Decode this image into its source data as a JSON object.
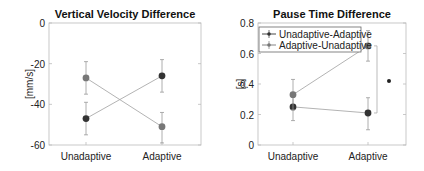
{
  "chart_data": [
    {
      "type": "line",
      "title": "Vertical Velocity Difference",
      "xlabel": "",
      "ylabel": "[mm/s]",
      "categories": [
        "Unadaptive",
        "Adaptive"
      ],
      "ylim": [
        -60,
        0
      ],
      "yticks": [
        0,
        -20,
        -40,
        -60
      ],
      "grid": false,
      "legend": null,
      "series": [
        {
          "name": "Unadaptive-Adaptive",
          "color": "#333333",
          "values": [
            -47,
            -26
          ],
          "err_low": [
            -55,
            -34
          ],
          "err_high": [
            -39,
            -18
          ]
        },
        {
          "name": "Adaptive-Unadaptive",
          "color": "#777777",
          "values": [
            -27,
            -51
          ],
          "err_low": [
            -35,
            -59
          ],
          "err_high": [
            -19,
            -44
          ]
        }
      ]
    },
    {
      "type": "line",
      "title": "Pause Time Difference",
      "xlabel": "",
      "ylabel": "[s]",
      "categories": [
        "Unadaptive",
        "Adaptive"
      ],
      "ylim": [
        0,
        0.8
      ],
      "yticks": [
        0.8,
        0.6,
        0.4,
        0.2,
        0
      ],
      "ytick_labels": [
        "0.8",
        "0.6",
        "0.4",
        "0.2",
        "0"
      ],
      "grid": false,
      "legend": {
        "position": "upper left",
        "entries": [
          "Unadaptive-Adaptive",
          "Adaptive-Unadaptive"
        ]
      },
      "series": [
        {
          "name": "Unadaptive-Adaptive",
          "color": "#333333",
          "values": [
            0.25,
            0.21
          ],
          "err_low": [
            0.16,
            0.1
          ],
          "err_high": [
            0.34,
            0.31
          ]
        },
        {
          "name": "Adaptive-Unadaptive",
          "color": "#777777",
          "values": [
            0.33,
            0.65
          ],
          "err_low": [
            0.23,
            0.55
          ],
          "err_high": [
            0.43,
            0.75
          ]
        }
      ],
      "annotations": [
        {
          "type": "significance",
          "category": "Adaptive",
          "from": 0.21,
          "to": 0.65,
          "marker": "*",
          "y": 0.42
        }
      ]
    }
  ]
}
